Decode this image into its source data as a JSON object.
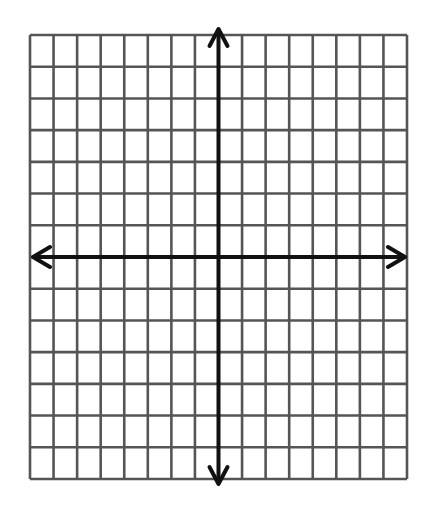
{
  "diagram": {
    "type": "coordinate-plane",
    "grid": {
      "columns": 16,
      "rows": 14,
      "columns_left_of_y_axis": 8,
      "columns_right_of_y_axis": 8,
      "rows_above_x_axis": 7,
      "rows_below_x_axis": 7
    },
    "axes": {
      "x_axis": {
        "arrows": [
          "left",
          "right"
        ]
      },
      "y_axis": {
        "arrows": [
          "up",
          "down"
        ]
      }
    },
    "colors": {
      "background": "#ffffff",
      "grid_line": "#555555",
      "axis": "#111111"
    },
    "labels": []
  }
}
